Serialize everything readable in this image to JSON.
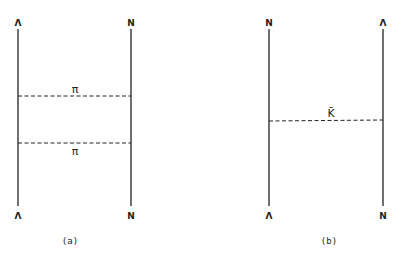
{
  "diagrams": [
    {
      "id": "a",
      "caption": "(a)",
      "left_line": {
        "top_label": "Λ",
        "bottom_label": "Λ"
      },
      "right_line": {
        "top_label": "N",
        "bottom_label": "N"
      },
      "exchanges": [
        {
          "label": "π",
          "label_position": "above"
        },
        {
          "label": "π",
          "label_position": "below"
        }
      ]
    },
    {
      "id": "b",
      "caption": "(b)",
      "left_line": {
        "top_label": "N",
        "bottom_label": "Λ"
      },
      "right_line": {
        "top_label": "Λ",
        "bottom_label": "N"
      },
      "exchanges": [
        {
          "label": "K̄",
          "label_position": "above"
        }
      ]
    }
  ]
}
